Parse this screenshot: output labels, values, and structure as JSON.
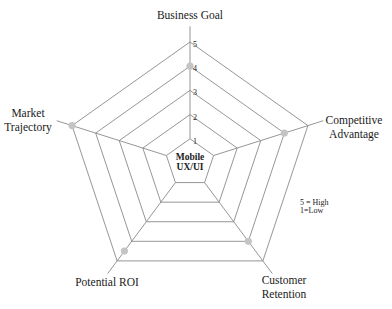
{
  "chart_data": {
    "type": "radar",
    "title": "",
    "center_label": [
      "Mobile",
      "UX/UI"
    ],
    "axes": [
      "Business Goal",
      "Competitive Advantage",
      "Customer Retention",
      "Potential ROI",
      "Market Trajectory"
    ],
    "axis_label_lines": [
      [
        "Business Goal"
      ],
      [
        "Competitive",
        "Advantage"
      ],
      [
        "Customer",
        "Retention"
      ],
      [
        "Potential ROI"
      ],
      [
        "Market",
        "Trajectory"
      ]
    ],
    "values": [
      4,
      4,
      4,
      4.5,
      5
    ],
    "scale": {
      "min": 1,
      "max": 5,
      "ticks": [
        "1",
        "2",
        "3",
        "4",
        "5"
      ]
    },
    "legend": [
      "5 = High",
      "1=Low"
    ],
    "legend_position": "right",
    "grid": true,
    "colors": {
      "grid": "#8a8a8a",
      "point": "#c4c4c4",
      "text": "#1a1a1a"
    }
  }
}
